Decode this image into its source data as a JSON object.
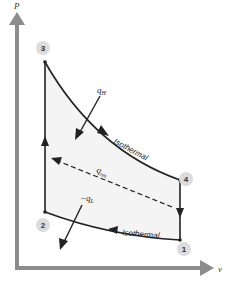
{
  "diagram": {
    "type": "P-v diagram",
    "axes": {
      "y_label": "P",
      "x_label": "v"
    },
    "points": [
      {
        "id": "1",
        "label": "1"
      },
      {
        "id": "2",
        "label": "2"
      },
      {
        "id": "3",
        "label": "3"
      },
      {
        "id": "4",
        "label": "4"
      }
    ],
    "processes": [
      {
        "from": "2",
        "to": "3",
        "kind": "constant-volume"
      },
      {
        "from": "3",
        "to": "4",
        "kind": "isothermal",
        "label": "Isothermal"
      },
      {
        "from": "4",
        "to": "1",
        "kind": "constant-volume"
      },
      {
        "from": "1",
        "to": "2",
        "kind": "isothermal",
        "label": "Isothermal"
      }
    ],
    "heat_labels": {
      "q_high": {
        "symbol": "q",
        "subscript": "H"
      },
      "q_low": {
        "symbol": "−q",
        "subscript": "L"
      },
      "q_regen": {
        "symbol": "q",
        "subscript": "res"
      }
    },
    "colors": {
      "axis": "#8c8c8c",
      "curve": "#222222",
      "region": "#f4f4f4",
      "label_circle": "#dcdcdc"
    }
  }
}
